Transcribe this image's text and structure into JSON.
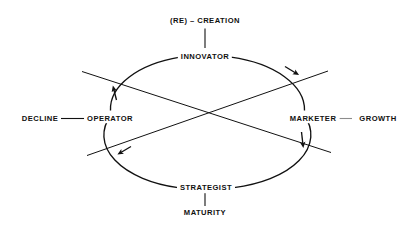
{
  "diagram": {
    "shape": "ellipse-with-cross",
    "stroke_color": "#111111",
    "faded_stroke_color": "#8c8c8c",
    "background": "#ffffff",
    "roles": [
      {
        "id": "innovator",
        "label": "INNOVATOR",
        "position": "top"
      },
      {
        "id": "marketer",
        "label": "MARKETER",
        "position": "right"
      },
      {
        "id": "strategist",
        "label": "STRATEGIST",
        "position": "bottom"
      },
      {
        "id": "operator",
        "label": "OPERATOR",
        "position": "left"
      }
    ],
    "phases": [
      {
        "id": "re-creation",
        "label": "(RE) – CREATION",
        "position": "top",
        "connects_to": "innovator"
      },
      {
        "id": "growth",
        "label": "GROWTH",
        "position": "right",
        "connects_to": "marketer"
      },
      {
        "id": "maturity",
        "label": "MATURITY",
        "position": "bottom",
        "connects_to": "strategist"
      },
      {
        "id": "decline",
        "label": "DECLINE",
        "position": "left",
        "connects_to": "operator"
      }
    ],
    "flow_arrows": [
      {
        "id": "operator-to-innovator",
        "from": "OPERATOR",
        "to": "INNOVATOR",
        "at": "upper-left"
      },
      {
        "id": "innovator-to-marketer",
        "from": "INNOVATOR",
        "to": "MARKETER",
        "at": "upper-right"
      },
      {
        "id": "marketer-to-strategist",
        "from": "MARKETER",
        "to": "STRATEGIST",
        "at": "lower-right"
      },
      {
        "id": "strategist-to-operator",
        "from": "STRATEGIST",
        "to": "OPERATOR",
        "at": "lower-left"
      }
    ]
  }
}
